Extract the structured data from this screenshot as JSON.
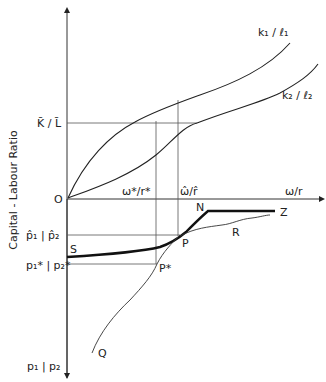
{
  "diagram": {
    "y_axis_title": "Capital - Labour Ratio",
    "x_axis_label": "ω/r",
    "origin_label": "O",
    "ratio_labels": {
      "k1_l1": "k₁ / ℓ₁",
      "k2_l2": "k₂ / ℓ₂",
      "endowment": "K̄ / L̄"
    },
    "wage_rent_labels": {
      "star": "ω*/r*",
      "hat": "ω̂/r̂"
    },
    "price_labels": {
      "hat": "p̂₁ | p̂₂",
      "star": "p₁* | p₂*",
      "axis": "p₁ | p₂"
    },
    "point_labels": {
      "S": "S",
      "N": "N",
      "Z": "Z",
      "R": "R",
      "P": "P",
      "P_star": "P*",
      "Q": "Q"
    }
  }
}
